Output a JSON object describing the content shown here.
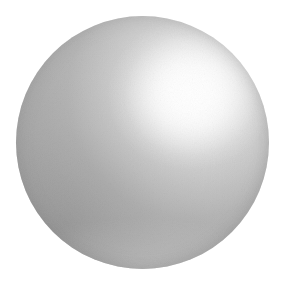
{
  "scene": {
    "title": "Shaded Sphere",
    "description": "A single smooth-shaded grey sphere rendered on a plain white background.",
    "canvas": {
      "width": 283,
      "height": 283,
      "background_color": "#ffffff"
    }
  },
  "object": {
    "name": "sphere",
    "shape": "circle",
    "center_x": 142,
    "center_y": 142,
    "diameter": 253,
    "radius": 126,
    "bounds": {
      "left": 16,
      "top": 16,
      "right": 269,
      "bottom": 269
    },
    "material": "matte-metallic-grey",
    "surface_texture": "fine dithered grain"
  },
  "shading": {
    "model": "diffuse-with-specular",
    "light_direction": "upper-right",
    "highlight": {
      "name": "specular-highlight",
      "center_x": 190,
      "center_y": 95,
      "relative_x_pct": 69,
      "relative_y_pct": 31,
      "color": "#ffffff"
    },
    "terminator": {
      "name": "shadow-terminator",
      "relative_x_pct": 20,
      "relative_y_pct": 82,
      "color": "#9a9a9a"
    },
    "ramp": [
      {
        "stop_pct": 0,
        "color": "#ffffff",
        "label": "specular core"
      },
      {
        "stop_pct": 12,
        "color": "#f0f0f0",
        "label": "highlight falloff"
      },
      {
        "stop_pct": 27,
        "color": "#d5d5d5",
        "label": "light midtone"
      },
      {
        "stop_pct": 50,
        "color": "#b7b7b7",
        "label": "body midtone"
      },
      {
        "stop_pct": 78,
        "color": "#a6a6a6",
        "label": "shadow midtone"
      },
      {
        "stop_pct": 100,
        "color": "#9f9f9f",
        "label": "terminator / rim"
      }
    ]
  },
  "palette": {
    "background": "#ffffff",
    "highlight": "#ffffff",
    "light_grey": "#e0e0e0",
    "mid_grey": "#b7b7b7",
    "body_grey": "#adadad",
    "shadow_grey": "#9f9f9f",
    "rim_grey": "#9a9a9a"
  }
}
